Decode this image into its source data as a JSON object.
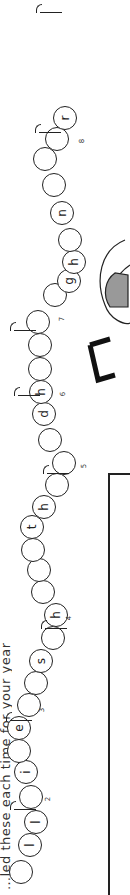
{
  "heading": {
    "text": "…led these each time for your year"
  },
  "beads": [
    {
      "x": 9,
      "y": 860,
      "letter": ""
    },
    {
      "x": 18,
      "y": 833,
      "letter": "l"
    },
    {
      "x": 24,
      "y": 810,
      "letter": "l"
    },
    {
      "x": 19,
      "y": 785,
      "letter": ""
    },
    {
      "x": 14,
      "y": 760,
      "letter": "i"
    },
    {
      "x": 7,
      "y": 739,
      "letter": ""
    },
    {
      "x": 7,
      "y": 716,
      "letter": "e"
    },
    {
      "x": 17,
      "y": 693,
      "letter": ""
    },
    {
      "x": 24,
      "y": 671,
      "letter": ""
    },
    {
      "x": 29,
      "y": 649,
      "letter": "s"
    },
    {
      "x": 41,
      "y": 626,
      "letter": ""
    },
    {
      "x": 44,
      "y": 603,
      "letter": "h"
    },
    {
      "x": 31,
      "y": 580,
      "letter": ""
    },
    {
      "x": 27,
      "y": 558,
      "letter": ""
    },
    {
      "x": 21,
      "y": 538,
      "letter": ""
    },
    {
      "x": 20,
      "y": 515,
      "letter": "t"
    },
    {
      "x": 32,
      "y": 495,
      "letter": "h"
    },
    {
      "x": 45,
      "y": 473,
      "letter": ""
    },
    {
      "x": 52,
      "y": 451,
      "letter": ""
    },
    {
      "x": 38,
      "y": 428,
      "letter": ""
    },
    {
      "x": 32,
      "y": 402,
      "letter": "d"
    },
    {
      "x": 29,
      "y": 380,
      "letter": "h"
    },
    {
      "x": 28,
      "y": 357,
      "letter": ""
    },
    {
      "x": 28,
      "y": 333,
      "letter": ""
    },
    {
      "x": 26,
      "y": 310,
      "letter": ""
    },
    {
      "x": 43,
      "y": 283,
      "letter": ""
    },
    {
      "x": 57,
      "y": 269,
      "letter": "g"
    },
    {
      "x": 62,
      "y": 250,
      "letter": "h"
    },
    {
      "x": 58,
      "y": 228,
      "letter": ""
    },
    {
      "x": 50,
      "y": 201,
      "letter": "n"
    },
    {
      "x": 42,
      "y": 173,
      "letter": ""
    },
    {
      "x": 33,
      "y": 147,
      "letter": ""
    },
    {
      "x": 45,
      "y": 127,
      "letter": ""
    },
    {
      "x": 53,
      "y": 106,
      "letter": "r"
    }
  ],
  "markers": [
    {
      "label": "2",
      "nx": 46,
      "ny": 795,
      "fx": 14,
      "fy": 809
    },
    {
      "label": "3",
      "nx": 40,
      "ny": 706,
      "fx": 10,
      "fy": 720
    },
    {
      "label": "4",
      "nx": 67,
      "ny": 614,
      "fx": 45,
      "fy": 628
    },
    {
      "label": "5",
      "nx": 82,
      "ny": 462,
      "fx": 47,
      "fy": 473
    },
    {
      "label": "6",
      "nx": 61,
      "ny": 390,
      "fx": 18,
      "fy": 395
    },
    {
      "label": "7",
      "nx": 60,
      "ny": 315,
      "fx": 14,
      "fy": 330
    },
    {
      "label": "8",
      "nx": 80,
      "ny": 137,
      "fx": 39,
      "fy": 132
    },
    {
      "label": "",
      "nx": 0,
      "ny": 0,
      "fx": 40,
      "fy": 12
    }
  ]
}
